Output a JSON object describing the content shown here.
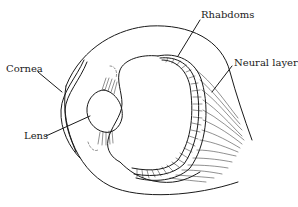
{
  "figure": {
    "stroke_color": "#1a1a1a",
    "background": "#ffffff",
    "labels": {
      "rhabdoms": "Rhabdoms",
      "neural_layers": "Neural layers",
      "cornea": "Cornea",
      "lens": "Lens"
    }
  }
}
